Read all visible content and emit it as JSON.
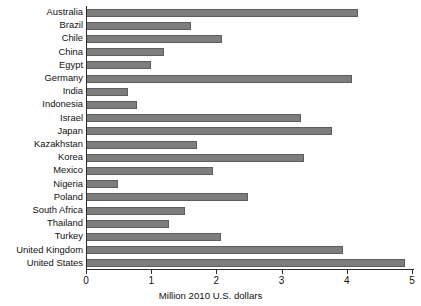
{
  "chart_data": {
    "type": "bar",
    "orientation": "horizontal",
    "title": "",
    "xlabel": "Million 2010 U.S. dollars",
    "ylabel": "",
    "xlim": [
      0,
      5
    ],
    "xticks": [
      0,
      1,
      2,
      3,
      4,
      5
    ],
    "xtick_labels": [
      "0",
      "1",
      "2",
      "3",
      "4",
      "5"
    ],
    "grid": false,
    "legend": "none",
    "bar_color": "#7d7d7d",
    "bar_edge_color": "#5d5d5d",
    "axis_color": "#2b2b2b",
    "categories": [
      "Australia",
      "Brazil",
      "Chile",
      "China",
      "Egypt",
      "Germany",
      "India",
      "Indonesia",
      "Israel",
      "Japan",
      "Kazakhstan",
      "Korea",
      "Mexico",
      "Nigeria",
      "Poland",
      "South Africa",
      "Thailand",
      "Turkey",
      "United Kingdom",
      "United States"
    ],
    "values": [
      4.15,
      1.6,
      2.07,
      1.18,
      0.98,
      4.07,
      0.63,
      0.77,
      3.28,
      3.75,
      1.68,
      3.33,
      1.93,
      0.47,
      2.47,
      1.5,
      1.26,
      2.05,
      3.92,
      4.88
    ]
  }
}
